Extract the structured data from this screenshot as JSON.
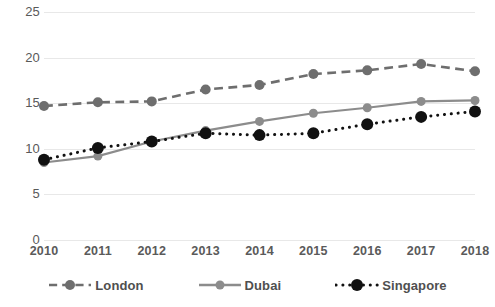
{
  "chart_data": {
    "type": "line",
    "title": "",
    "subtitle": "",
    "xlabel": "",
    "ylabel": "",
    "categories": [
      "2010",
      "2011",
      "2012",
      "2013",
      "2014",
      "2015",
      "2016",
      "2017",
      "2018"
    ],
    "x": [
      2010,
      2011,
      2012,
      2013,
      2014,
      2015,
      2016,
      2017,
      2018
    ],
    "ylim": [
      0,
      25
    ],
    "xlim": [
      2010,
      2018
    ],
    "yticks": [
      0,
      5,
      10,
      15,
      20,
      25
    ],
    "ytick_labels": [
      "0",
      "5",
      "10",
      "15",
      "20",
      "25"
    ],
    "grid": "horizontal",
    "legend_position": "bottom",
    "series": [
      {
        "name": "London",
        "values": [
          14.7,
          15.1,
          15.2,
          16.5,
          17.0,
          18.2,
          18.6,
          19.3,
          18.5
        ],
        "color": "#6e6e6e",
        "line_style": "dashed",
        "marker": "circle",
        "marker_size": 5
      },
      {
        "name": "Dubai",
        "values": [
          8.5,
          9.2,
          10.8,
          12.0,
          13.0,
          13.9,
          14.5,
          15.2,
          15.3
        ],
        "color": "#8c8c8c",
        "line_style": "solid",
        "marker": "circle",
        "marker_size": 4.5
      },
      {
        "name": "Singapore",
        "values": [
          8.8,
          10.1,
          10.8,
          11.7,
          11.5,
          11.7,
          12.7,
          13.5,
          14.1
        ],
        "color": "#111111",
        "line_style": "dotted",
        "marker": "circle",
        "marker_size": 6
      }
    ]
  },
  "legend": {
    "items": [
      {
        "label": "London"
      },
      {
        "label": "Dubai"
      },
      {
        "label": "Singapore"
      }
    ]
  },
  "colors": {
    "gridline": "#e8e8e8",
    "axis_text": "#595959",
    "background": "#ffffff",
    "london": "#6e6e6e",
    "dubai": "#8c8c8c",
    "singapore": "#111111"
  }
}
